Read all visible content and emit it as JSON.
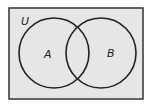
{
  "diagram": {
    "type": "venn",
    "universe_label": "U",
    "sets": [
      {
        "label": "A",
        "cx": 54,
        "cy": 53,
        "r": 35
      },
      {
        "label": "B",
        "cx": 101,
        "cy": 53,
        "r": 35
      }
    ],
    "colors": {
      "fill": "#e6e6e6",
      "stroke": "#222222",
      "background": "#ffffff"
    }
  }
}
